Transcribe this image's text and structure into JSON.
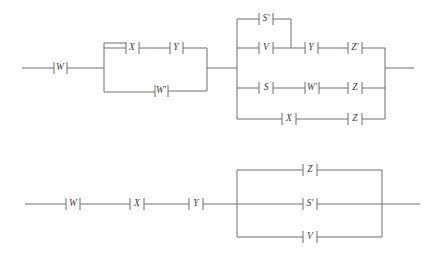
{
  "diagram": {
    "type": "switching-circuit-network",
    "canvas": {
      "width": 434,
      "height": 258
    },
    "style": {
      "wire_color": "#6f6f6f",
      "label_color": "#3d3d3d",
      "background": "#ffffff"
    },
    "circuits": [
      {
        "id": "top-circuit",
        "name": "upper-network",
        "elements": [
          {
            "id": "t-w",
            "label": "W",
            "x": 60,
            "y": 68
          },
          {
            "id": "t-x1",
            "label": "X",
            "x": 132,
            "y": 48
          },
          {
            "id": "t-y1",
            "label": "Y",
            "x": 176,
            "y": 48
          },
          {
            "id": "t-wp",
            "label": "W'",
            "x": 161,
            "y": 90
          },
          {
            "id": "t-sp",
            "label": "S'",
            "x": 266,
            "y": 19
          },
          {
            "id": "t-v",
            "label": "V",
            "x": 266,
            "y": 48
          },
          {
            "id": "t-y2",
            "label": "Y",
            "x": 312,
            "y": 48
          },
          {
            "id": "t-zp",
            "label": "Z'",
            "x": 355,
            "y": 48
          },
          {
            "id": "t-s",
            "label": "S",
            "x": 266,
            "y": 88
          },
          {
            "id": "t-wp2",
            "label": "W'",
            "x": 312,
            "y": 88
          },
          {
            "id": "t-z1",
            "label": "Z",
            "x": 355,
            "y": 88
          },
          {
            "id": "t-x2",
            "label": "X",
            "x": 289,
            "y": 119
          },
          {
            "id": "t-z2",
            "label": "Z",
            "x": 355,
            "y": 119
          }
        ]
      },
      {
        "id": "bottom-circuit",
        "name": "lower-network",
        "elements": [
          {
            "id": "b-w",
            "label": "W",
            "x": 73,
            "y": 204
          },
          {
            "id": "b-x",
            "label": "X",
            "x": 137,
            "y": 204
          },
          {
            "id": "b-y",
            "label": "Y",
            "x": 196,
            "y": 204
          },
          {
            "id": "b-z",
            "label": "Z",
            "x": 310,
            "y": 170
          },
          {
            "id": "b-sp",
            "label": "S'",
            "x": 310,
            "y": 204
          },
          {
            "id": "b-v",
            "label": "V",
            "x": 310,
            "y": 237
          }
        ]
      }
    ]
  }
}
